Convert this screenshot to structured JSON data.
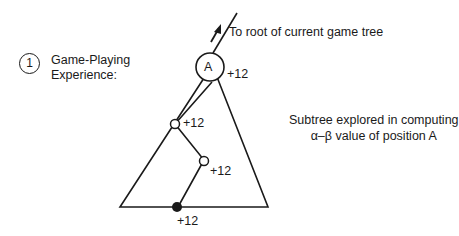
{
  "heading": {
    "number": "1",
    "title_line1": "Game-Playing",
    "title_line2": "Experience:"
  },
  "root_annotation": "To root of current game tree",
  "subtree_annotation": {
    "line1": "Subtree explored in computing",
    "line2": "α–β  value of position A"
  },
  "tree": {
    "root_node": {
      "label": "A",
      "value": "+12"
    },
    "path_nodes": [
      {
        "type": "open",
        "value": "+12"
      },
      {
        "type": "open",
        "value": "+12"
      },
      {
        "type": "filled",
        "value": "+12"
      }
    ]
  },
  "colors": {
    "ink": "#1a1a1a",
    "background": "#ffffff"
  }
}
